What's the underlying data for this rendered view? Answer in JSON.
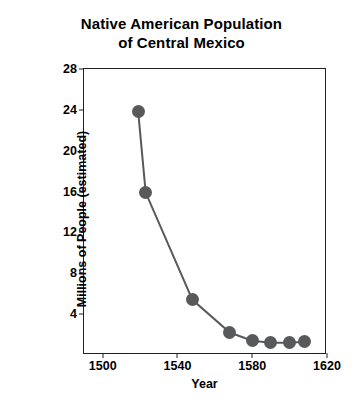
{
  "chart_data": {
    "type": "line",
    "title": "Native American Population of Central Mexico",
    "title_lines": [
      "Native American Population",
      "of Central Mexico"
    ],
    "xlabel": "Year",
    "ylabel": "Millions of People (estimated)",
    "xlim": [
      1490,
      1620
    ],
    "ylim": [
      0,
      28
    ],
    "xticks": [
      1500,
      1540,
      1580,
      1620
    ],
    "yticks": [
      4,
      8,
      12,
      16,
      20,
      24,
      28
    ],
    "grid": false,
    "legend": "none",
    "marker_color": "#58595b",
    "line_color": "#58595b",
    "frame_color": "#231f20",
    "x": [
      1519,
      1523,
      1548,
      1568,
      1580,
      1590,
      1600,
      1608
    ],
    "y": [
      23.8,
      15.9,
      5.4,
      2.2,
      1.4,
      1.2,
      1.2,
      1.3
    ],
    "series": [
      {
        "name": "Native American population of Central Mexico",
        "points": [
          {
            "year": 1519,
            "millions": 23.8
          },
          {
            "year": 1523,
            "millions": 15.9
          },
          {
            "year": 1548,
            "millions": 5.4
          },
          {
            "year": 1568,
            "millions": 2.2
          },
          {
            "year": 1580,
            "millions": 1.4
          },
          {
            "year": 1590,
            "millions": 1.2
          },
          {
            "year": 1600,
            "millions": 1.2
          },
          {
            "year": 1608,
            "millions": 1.3
          }
        ]
      }
    ]
  }
}
